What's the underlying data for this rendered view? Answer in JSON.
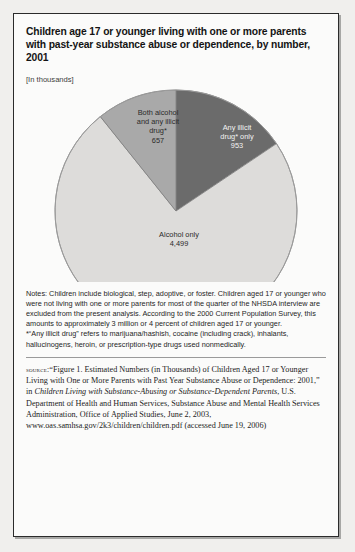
{
  "figure": {
    "title": "Children age 17 or younger living with one or more parents with past-year substance abuse or dependence, by number, 2001",
    "units_note": "[In thousands]"
  },
  "chart_data": {
    "type": "pie",
    "title": "Children age 17 or younger living with one or more parents with past-year substance abuse or dependence, by number, 2001",
    "units": "thousands",
    "categories": [
      "Any illicit drug* only",
      "Both alcohol and any illicit drug*",
      "Alcohol only"
    ],
    "values": [
      953,
      657,
      4499
    ],
    "total": 6109,
    "legend_position": "none",
    "labels_inside": true,
    "slices": [
      {
        "name": "Any illicit drug* only",
        "label_lines": [
          "Any illicit",
          "drug* only",
          "953"
        ],
        "value": 953,
        "color": "#6b6b6b",
        "text_color": "#f4f4f4",
        "start_angle_deg": 0,
        "sweep_deg": 56.2
      },
      {
        "name": "Both alcohol and any illicit drug*",
        "label_lines": [
          "Both alcohol",
          "and any illicit",
          "drug*",
          "657"
        ],
        "value": 657,
        "color": "#a9a9a9",
        "text_color": "#2a2a2a",
        "start_angle_deg": -38.7,
        "sweep_deg": 38.7
      },
      {
        "name": "Alcohol only",
        "label_lines": [
          "Alcohol only",
          "4,499"
        ],
        "value": 4499,
        "color": "#dddcda",
        "text_color": "#2a2a2a",
        "start_angle_deg": 56.2,
        "sweep_deg": 265.1
      }
    ]
  },
  "slice_labels": {
    "illicit_line1": "Any illicit",
    "illicit_line2": "drug* only",
    "illicit_value": "953",
    "both_line1": "Both alcohol",
    "both_line2": "and any illicit",
    "both_line3": "drug*",
    "both_value": "657",
    "alcohol_line1": "Alcohol only",
    "alcohol_value": "4,499"
  },
  "notes": {
    "paragraph1": "Notes: Children include biological, step, adoptive, or foster. Children aged 17 or younger who were not living with one or more parents for most of the quarter of the NHSDA interview are excluded from the present analysis. According to the 2000 Current Population Survey, this amounts to approximately 3 million or 4 percent of children aged 17 or younger.",
    "paragraph2": "*“Any illicit drug” refers to marijuana/hashish, cocaine (including crack), inhalants, hallucinogens, heroin, or prescription-type drugs used nonmedically."
  },
  "source": {
    "label": "source:",
    "part1": "“Figure 1. Estimated Numbers (in Thousands) of Children Aged 17 or Younger Living with One or More Parents with Past Year Substance Abuse or Dependence: 2001,” in ",
    "italic_title": "Children Living with Substance-Abusing or Substance-Dependent Parents",
    "part2": ", U.S. Department of Health and Human Services, Substance Abuse and Mental Health Services Administration, Office of Applied Studies, June 2, 2003, www.oas.samhsa.gov/2k3/children/children.pdf (accessed June 19, 2006)"
  }
}
